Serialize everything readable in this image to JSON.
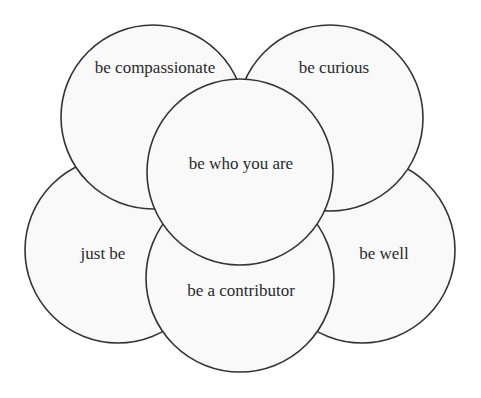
{
  "diagram": {
    "type": "overlapping-circles",
    "circles": [
      {
        "id": "left",
        "label": "just be",
        "cx": 118,
        "cy": 250,
        "r": 93,
        "lx": 103,
        "ly": 255
      },
      {
        "id": "right",
        "label": "be well",
        "cx": 362,
        "cy": 250,
        "r": 93,
        "lx": 384,
        "ly": 255
      },
      {
        "id": "top-left",
        "label": "be compassionate",
        "cx": 153,
        "cy": 117,
        "r": 92,
        "lx": 155,
        "ly": 69
      },
      {
        "id": "top-right",
        "label": "be curious",
        "cx": 330,
        "cy": 118,
        "r": 93,
        "lx": 334,
        "ly": 69
      },
      {
        "id": "bottom",
        "label": "be a contributor",
        "cx": 240,
        "cy": 278,
        "r": 94,
        "lx": 241,
        "ly": 292
      },
      {
        "id": "center",
        "label": "be who you are",
        "cx": 240,
        "cy": 172,
        "r": 93,
        "lx": 241,
        "ly": 165
      }
    ],
    "colors": {
      "fill": "#f9f9f9",
      "stroke": "#333333",
      "text": "#2a2a2a"
    }
  }
}
